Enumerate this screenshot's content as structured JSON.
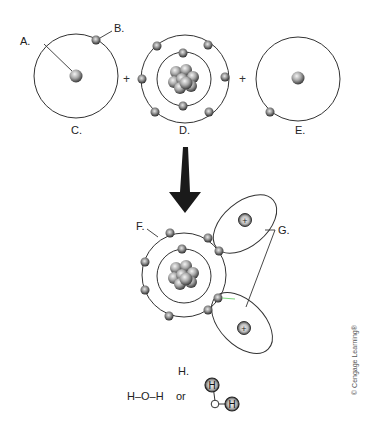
{
  "diagram": {
    "labels": {
      "a": "A.",
      "b": "B.",
      "c": "C.",
      "d": "D.",
      "e": "E.",
      "f": "F.",
      "g": "G.",
      "h": "H."
    },
    "operators": {
      "plus_1": "+",
      "plus_2": "+"
    },
    "formula": {
      "text": "H–O–H",
      "or": "or",
      "ball_h1": "H",
      "ball_h2": "H",
      "ball_o": "O"
    },
    "proton_sign_1": "+",
    "proton_sign_2": "+",
    "copyright": "© Cengage Learning®",
    "colors": {
      "line": "#333333",
      "electron": "#3a3a3a",
      "bond_highlight": "#7ed87e"
    }
  }
}
